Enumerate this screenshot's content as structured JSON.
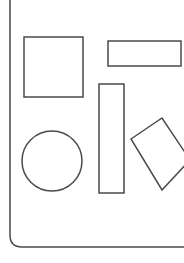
{
  "diagram": {
    "stroke_color": "#4a4a4a",
    "background": "#ffffff",
    "frame": {
      "kind": "rounded-frame",
      "x": 10,
      "bottom": 247,
      "corner_radius": 12
    },
    "shapes": [
      {
        "id": "square",
        "kind": "rect",
        "x": 24,
        "y": 37,
        "w": 59,
        "h": 60
      },
      {
        "id": "horizontal-rect",
        "kind": "rect",
        "x": 108,
        "y": 41,
        "w": 73,
        "h": 25
      },
      {
        "id": "vertical-rect",
        "kind": "rect",
        "x": 99,
        "y": 84,
        "w": 25,
        "h": 109
      },
      {
        "id": "circle",
        "kind": "circle",
        "cx": 52,
        "cy": 161,
        "r": 30
      },
      {
        "id": "rotated-rect",
        "kind": "polygon",
        "points": "131,139 162,118 190,160 162,190"
      }
    ]
  }
}
